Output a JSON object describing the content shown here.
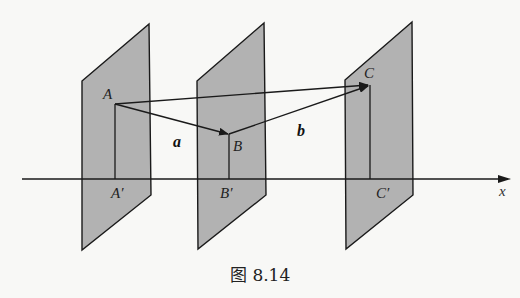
{
  "figure": {
    "caption": "图 8.14",
    "colors": {
      "plane_fill": "#b2b2b2",
      "line": "#1a1a1a",
      "background": "#f8f8f6"
    },
    "axis": {
      "label": "x"
    },
    "points": {
      "A": "A",
      "B": "B",
      "C": "C",
      "A_proj": "A′",
      "B_proj": "B′",
      "C_proj": "C′"
    },
    "vectors": {
      "a": "a",
      "b": "b"
    },
    "planes": [
      "plane-through-A",
      "plane-through-B",
      "plane-through-C"
    ]
  }
}
